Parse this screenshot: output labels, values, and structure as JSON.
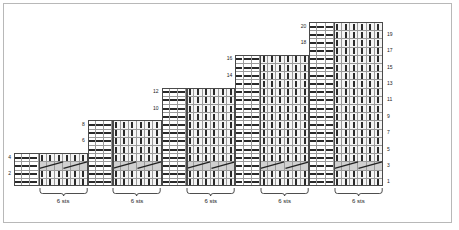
{
  "chart_data": {
    "type": "table",
    "grid": {
      "columns": 45,
      "rows": 20,
      "cell_width": 8.2,
      "cell_height": 8.2,
      "origin_x": 14,
      "origin_y": 186,
      "direction": "rows numbered bottom to top"
    },
    "blocks": [
      {
        "index": 0,
        "start_col": 0,
        "cols": 9,
        "rows": 4,
        "purl_cols": 3,
        "knit_cols": 6,
        "top_row_label": "4",
        "second_label": "2",
        "cable_row": 3
      },
      {
        "index": 1,
        "start_col": 9,
        "cols": 9,
        "rows": 8,
        "purl_cols": 3,
        "knit_cols": 6,
        "top_row_label": "8",
        "second_label": "6",
        "cable_row": 3
      },
      {
        "index": 2,
        "start_col": 18,
        "cols": 9,
        "rows": 12,
        "purl_cols": 3,
        "knit_cols": 6,
        "top_row_label": "12",
        "second_label": "10",
        "cable_row": 3
      },
      {
        "index": 3,
        "start_col": 27,
        "cols": 9,
        "rows": 16,
        "purl_cols": 3,
        "knit_cols": 6,
        "top_row_label": "16",
        "second_label": "14",
        "cable_row": 3
      },
      {
        "index": 4,
        "start_col": 36,
        "cols": 9,
        "rows": 20,
        "purl_cols": 3,
        "knit_cols": 6,
        "top_row_label": "20",
        "second_label": "18",
        "cable_row": 3
      }
    ],
    "row_labels_left": [
      "2",
      "4",
      "6",
      "8",
      "10",
      "12",
      "14",
      "16",
      "18",
      "20"
    ],
    "row_labels_right": [
      "1",
      "3",
      "5",
      "7",
      "9",
      "11",
      "13",
      "15",
      "17",
      "19"
    ],
    "stitch_brackets": [
      {
        "label": "6 sts",
        "start_col": 3,
        "cols": 6
      },
      {
        "label": "6 sts",
        "start_col": 12,
        "cols": 6
      },
      {
        "label": "6 sts",
        "start_col": 21,
        "cols": 6
      },
      {
        "label": "6 sts",
        "start_col": 30,
        "cols": 6
      },
      {
        "label": "6 sts",
        "start_col": 39,
        "cols": 6
      }
    ],
    "symbols": {
      "purl": "dash",
      "knit": "vertical-bar",
      "cable": "diagonal-cross"
    },
    "colors": {
      "grid_line": "#9a9a9a",
      "block_outline": "#4a4a4a",
      "knit_fill": "#f4f4f4",
      "purl_fill": "#ffffff",
      "cable_band_fill": "#d0d0d0",
      "symbol": "#2a2a2a",
      "frame_border": "#b8b8b8",
      "background": "#ffffff"
    }
  }
}
